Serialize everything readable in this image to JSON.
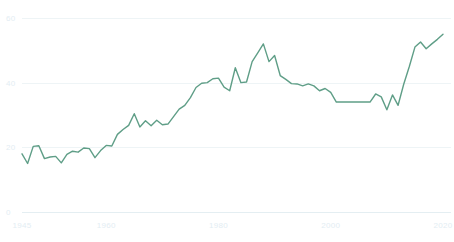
{
  "chart_data": {
    "type": "line",
    "title": "",
    "subtitle": "",
    "xlabel": "",
    "ylabel": "",
    "grid": true,
    "legend": false,
    "legend_position": "none",
    "xlim": [
      1945,
      2020
    ],
    "ylim": [
      0,
      60
    ],
    "xticks": [
      1945,
      1960,
      1980,
      2000,
      2020
    ],
    "xtick_labels": [
      "1945",
      "1960",
      "1980",
      "2000",
      "2020"
    ],
    "yticks": [
      0,
      20,
      40,
      60
    ],
    "ytick_labels": [
      "0",
      "20",
      "40",
      "60"
    ],
    "series": [
      {
        "name": "series-1",
        "color": "#5f9e87",
        "stroke_width": 1.4,
        "x": [
          1945,
          1946,
          1947,
          1948,
          1949,
          1950,
          1951,
          1952,
          1953,
          1954,
          1955,
          1956,
          1957,
          1958,
          1959,
          1960,
          1961,
          1962,
          1963,
          1964,
          1965,
          1966,
          1967,
          1968,
          1969,
          1970,
          1971,
          1972,
          1973,
          1974,
          1975,
          1976,
          1977,
          1978,
          1979,
          1980,
          1981,
          1982,
          1983,
          1984,
          1985,
          1986,
          1987,
          1988,
          1989,
          1990,
          1991,
          1992,
          1993,
          1994,
          1995,
          1996,
          1997,
          1998,
          1999,
          2000,
          2001,
          2002,
          2003,
          2004,
          2005,
          2006,
          2007,
          2008,
          2009,
          2010,
          2011,
          2012,
          2013,
          2014,
          2015,
          2016,
          2017,
          2018,
          2019,
          2020
        ],
        "values": [
          18.0,
          15.0,
          20.3,
          20.5,
          16.5,
          17.0,
          17.2,
          15.2,
          17.8,
          18.8,
          18.5,
          19.8,
          19.6,
          16.8,
          19.0,
          20.6,
          20.4,
          24.0,
          25.5,
          26.8,
          30.4,
          26.3,
          28.2,
          26.7,
          28.4,
          27.0,
          27.2,
          29.5,
          31.8,
          33.0,
          35.4,
          38.5,
          39.8,
          40.0,
          41.2,
          41.4,
          38.6,
          37.5,
          44.6,
          40.0,
          40.2,
          46.5,
          49.2,
          52.0,
          46.5,
          48.4,
          42.2,
          41.0,
          39.7,
          39.6,
          39.0,
          39.6,
          39.0,
          37.5,
          38.2,
          37.0,
          34.0,
          34.0,
          34.0,
          34.0,
          34.0,
          34.0,
          34.0,
          36.5,
          35.6,
          31.6,
          36.2,
          33.0,
          39.5,
          45.0,
          51.0,
          52.6,
          50.5,
          52.0,
          53.4,
          55.0
        ]
      }
    ]
  },
  "axes": {
    "x_axis_name": "year-axis",
    "y_axis_name": "value-axis"
  }
}
